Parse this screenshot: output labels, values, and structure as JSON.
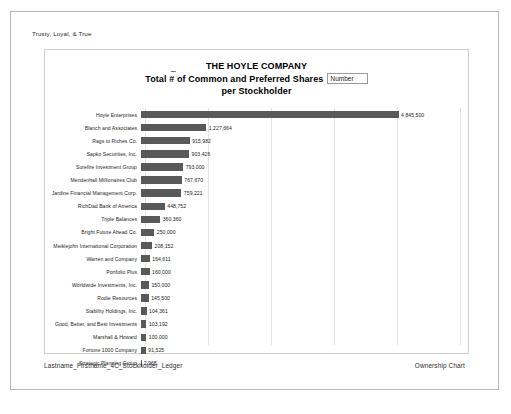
{
  "document": {
    "header_text": "Trusty, Loyal, & True",
    "footer_left": "Lastname_Firstname_4C_Stockholder_Ledger",
    "footer_right": "Ownership Chart"
  },
  "chart_data": {
    "type": "bar",
    "orientation": "horizontal",
    "title": "THE HOYLE COMPANY",
    "title_line2_pre": "Total ",
    "title_line2_hash": "#",
    "title_line2_post": " of Common and Preferred Shares",
    "title_line3": "per Stockholder",
    "legend_label": "Number",
    "legend_position": "top-right-inline",
    "xlabel": "",
    "ylabel": "",
    "grid": true,
    "gridline_count": 5,
    "xlim": [
      0,
      6000000
    ],
    "bar_color": "#595959",
    "categories": [
      "Hoyle Enterprises",
      "Blanch and Associates",
      "Rags to Riches Co.",
      "Sapko Securities, Inc.",
      "Surefire Investment Group",
      "Mendenhall Millionaires Club",
      "Jardine Financial Management Corp.",
      "RichDad Bank of America",
      "Triple Balances",
      "Bright Future Ahead Co.",
      "Meiklejohn International Corporation",
      "Warren and Company",
      "Portfolio Plus",
      "Worldwide Investments, Inc.",
      "Rodie Resources",
      "Stability Holdings, Inc.",
      "Good, Better, and Best Investments",
      "Marshall & Howard",
      "Fortune 1000 Company",
      "Strategic Planning Group"
    ],
    "values": [
      4845500,
      1227664,
      915982,
      903426,
      793000,
      767670,
      759221,
      448752,
      360360,
      250000,
      208152,
      164611,
      160000,
      150000,
      145500,
      104361,
      103192,
      100000,
      91525,
      2968
    ],
    "value_labels": [
      "4,845,500",
      "1,227,664",
      "915,982",
      "903,426",
      "793,000",
      "767,670",
      "759,221",
      "448,752",
      "360,360",
      "250,000",
      "208,152",
      "164,611",
      "160,000",
      "150,000",
      "145,500",
      "104,361",
      "103,192",
      "100,000",
      "91,525",
      "2,968"
    ]
  }
}
